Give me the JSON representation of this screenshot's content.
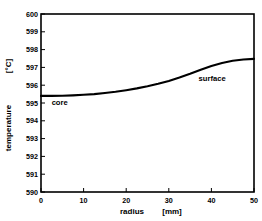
{
  "chart_data": {
    "type": "line",
    "title": "",
    "xlabel": "radius",
    "xunit": "[mm]",
    "ylabel": "temperature",
    "yunit": "[°C]",
    "xlim": [
      0,
      50
    ],
    "ylim": [
      590,
      600
    ],
    "xticks": [
      0,
      10,
      20,
      30,
      40,
      50
    ],
    "xticklabels": [
      "0",
      "10",
      "20",
      "30",
      "40",
      "50"
    ],
    "yticks": [
      590,
      591,
      592,
      593,
      594,
      595,
      596,
      597,
      598,
      599,
      600
    ],
    "yticklabels": [
      "590",
      "591",
      "592",
      "593",
      "594",
      "595",
      "596",
      "597",
      "598",
      "599",
      "600"
    ],
    "grid": false,
    "legend": "none",
    "series": [
      {
        "name": "temperature profile",
        "color": "#000000",
        "x": [
          0,
          2.5,
          5,
          7.5,
          10,
          12.5,
          15,
          17.5,
          20,
          22.5,
          25,
          27.5,
          30,
          32.5,
          35,
          37.5,
          40,
          42.5,
          45,
          47.5,
          50
        ],
        "values": [
          595.4,
          595.4,
          595.41,
          595.43,
          595.46,
          595.5,
          595.56,
          595.63,
          595.72,
          595.82,
          595.94,
          596.08,
          596.24,
          596.43,
          596.64,
          596.87,
          597.08,
          597.25,
          597.37,
          597.44,
          597.48
        ]
      }
    ],
    "annotations": [
      {
        "text": "core",
        "x": 2.5,
        "y": 594.9
      },
      {
        "text": "surface",
        "x": 37.0,
        "y": 596.25
      }
    ]
  }
}
